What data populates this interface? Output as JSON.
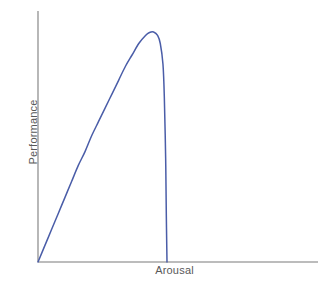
{
  "chart_data": {
    "type": "line",
    "title": "",
    "subtitle": "",
    "xlabel": "Arousal",
    "ylabel": "Performance",
    "legend": [],
    "legend_position": "none",
    "grid": false,
    "xlim": [
      0,
      1
    ],
    "ylim": [
      0,
      1
    ],
    "xticks": [],
    "yticks": [],
    "xticklabels": [],
    "yticklabels": [],
    "annotations": [],
    "series": [
      {
        "name": "Arousal vs Performance",
        "color": "#4a5da8",
        "linewidth": 1.5,
        "description": "Inverted-U (Yerkes-Dodson) curve: rises nearly linearly from the origin, bends over to a rounded peak at roughly 80% of the arousal range, then falls off very steeply and almost vertically back to the baseline.",
        "x": [
          0.0,
          0.05,
          0.1,
          0.15,
          0.2,
          0.25,
          0.3,
          0.35,
          0.4,
          0.45,
          0.5,
          0.55,
          0.6,
          0.65,
          0.7,
          0.75,
          0.8,
          0.83,
          0.86,
          0.89,
          0.91,
          0.93,
          0.94,
          0.95,
          0.955,
          0.96
        ],
        "y": [
          0.0,
          0.07,
          0.14,
          0.21,
          0.28,
          0.35,
          0.42,
          0.48,
          0.55,
          0.61,
          0.67,
          0.73,
          0.79,
          0.85,
          0.9,
          0.95,
          0.985,
          0.998,
          1.0,
          0.985,
          0.95,
          0.86,
          0.72,
          0.45,
          0.2,
          0.0
        ],
        "peak": {
          "x": 0.86,
          "y": 1.0
        }
      }
    ],
    "colors": {
      "curve": "#4a5da8",
      "axis": "#a6a6a6",
      "label_text": "#595959",
      "background": "#ffffff"
    },
    "geometry": {
      "origin": {
        "x": 38,
        "y": 262
      },
      "y_axis_top": {
        "x": 38,
        "y": 11
      },
      "x_axis_right": {
        "x": 318,
        "y": 262
      },
      "peak_px": {
        "x": 149,
        "y": 32
      },
      "drop_foot_px": {
        "x": 167,
        "y": 262
      }
    }
  },
  "axes": {
    "x_label": "Arousal",
    "y_label": "Performance"
  }
}
